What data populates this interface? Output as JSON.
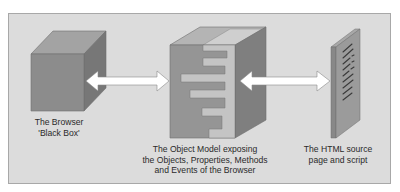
{
  "diagram": {
    "nodes": [
      {
        "id": "browser",
        "label_line1": "The Browser",
        "label_line2": "'Black Box'",
        "shape": "solid-cube"
      },
      {
        "id": "object-model",
        "label_line1": "The Object Model exposing",
        "label_line2": "the Objects, Properties, Methods",
        "label_line3": "and Events of the Browser",
        "shape": "cube-with-interface-cutouts"
      },
      {
        "id": "html-source",
        "label_line1": "The HTML source",
        "label_line2": "page and script",
        "shape": "page-slab"
      }
    ],
    "edges": [
      {
        "from": "browser",
        "to": "object-model",
        "type": "bidirectional-arrow"
      },
      {
        "from": "object-model",
        "to": "html-source",
        "type": "bidirectional-arrow"
      }
    ],
    "colors": {
      "background": "#dcdcdc",
      "cube_front": "#8f8f8f",
      "cube_top": "#a5a5a5",
      "cube_side": "#7a7a7a",
      "arrow_fill": "#ffffff",
      "text": "#2a2a2a"
    }
  }
}
